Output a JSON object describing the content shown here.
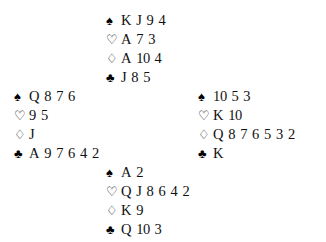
{
  "diagram": {
    "kind": "bridge-deal",
    "suit_glyphs": {
      "spades": "♠",
      "hearts": "♡",
      "diamonds": "♢",
      "clubs": "♣"
    },
    "colors": {
      "background": "#ffffff",
      "ink": "#111111"
    }
  },
  "hands": {
    "north": {
      "position": "North",
      "suits": [
        {
          "suit": "spades",
          "symbol": "♠",
          "style": "filled",
          "cards": [
            "K",
            "J",
            "9",
            "4"
          ]
        },
        {
          "suit": "hearts",
          "symbol": "♡",
          "style": "outlined",
          "cards": [
            "A",
            "7",
            "3"
          ]
        },
        {
          "suit": "diamonds",
          "symbol": "♢",
          "style": "outlined",
          "cards": [
            "A",
            "10",
            "4"
          ]
        },
        {
          "suit": "clubs",
          "symbol": "♣",
          "style": "filled",
          "cards": [
            "J",
            "8",
            "5"
          ]
        }
      ]
    },
    "west": {
      "position": "West",
      "suits": [
        {
          "suit": "spades",
          "symbol": "♠",
          "style": "filled",
          "cards": [
            "Q",
            "8",
            "7",
            "6"
          ]
        },
        {
          "suit": "hearts",
          "symbol": "♡",
          "style": "outlined",
          "cards": [
            "9",
            "5"
          ]
        },
        {
          "suit": "diamonds",
          "symbol": "♢",
          "style": "outlined",
          "cards": [
            "J"
          ]
        },
        {
          "suit": "clubs",
          "symbol": "♣",
          "style": "filled",
          "cards": [
            "A",
            "9",
            "7",
            "6",
            "4",
            "2"
          ]
        }
      ]
    },
    "east": {
      "position": "East",
      "suits": [
        {
          "suit": "spades",
          "symbol": "♠",
          "style": "filled",
          "cards": [
            "10",
            "5",
            "3"
          ]
        },
        {
          "suit": "hearts",
          "symbol": "♡",
          "style": "outlined",
          "cards": [
            "K",
            "10"
          ]
        },
        {
          "suit": "diamonds",
          "symbol": "♢",
          "style": "outlined",
          "cards": [
            "Q",
            "8",
            "7",
            "6",
            "5",
            "3",
            "2"
          ]
        },
        {
          "suit": "clubs",
          "symbol": "♣",
          "style": "filled",
          "cards": [
            "K"
          ]
        }
      ]
    },
    "south": {
      "position": "South",
      "suits": [
        {
          "suit": "spades",
          "symbol": "♠",
          "style": "filled",
          "cards": [
            "A",
            "2"
          ]
        },
        {
          "suit": "hearts",
          "symbol": "♡",
          "style": "outlined",
          "cards": [
            "Q",
            "J",
            "8",
            "6",
            "4",
            "2"
          ]
        },
        {
          "suit": "diamonds",
          "symbol": "♢",
          "style": "outlined",
          "cards": [
            "K",
            "9"
          ]
        },
        {
          "suit": "clubs",
          "symbol": "♣",
          "style": "filled",
          "cards": [
            "Q",
            "10",
            "3"
          ]
        }
      ]
    }
  }
}
